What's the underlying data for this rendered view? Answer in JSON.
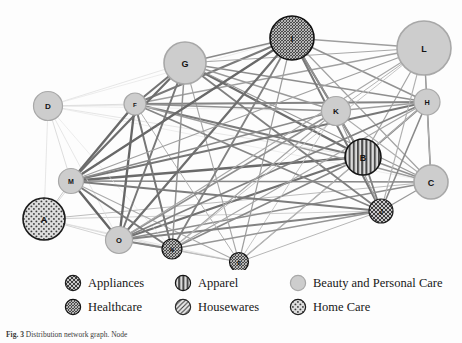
{
  "figure": {
    "caption_label": "Fig. 3",
    "caption_text": "Distribution network graph. Node",
    "background": "#fdfdfd"
  },
  "chart_data": {
    "type": "network-graph",
    "title": "",
    "grid": false,
    "legend_position": "bottom",
    "categories": [
      {
        "key": "appliances",
        "label": "Appliances",
        "pattern": "crosshatch-diagonal",
        "fill": "#c9c9c9",
        "stroke": "#1c1c1c"
      },
      {
        "key": "apparel",
        "label": "Apparel",
        "pattern": "vertical-stripes",
        "fill": "#bdbdbd",
        "stroke": "#141414"
      },
      {
        "key": "beauty",
        "label": "Beauty and Personal Care",
        "pattern": "solid",
        "fill": "#cdcdcd",
        "stroke": "#a8a8a8"
      },
      {
        "key": "healthcare",
        "label": "Healthcare",
        "pattern": "dense-mesh",
        "fill": "#6e6e6e",
        "stroke": "#111111"
      },
      {
        "key": "housewares",
        "label": "Housewares",
        "pattern": "diagonal-lines",
        "fill": "#e2e2e2",
        "stroke": "#2a2a2a"
      },
      {
        "key": "homecare",
        "label": "Home Care",
        "pattern": "dots",
        "fill": "#d8d8d8",
        "stroke": "#1c1c1c"
      }
    ],
    "nodes": [
      {
        "id": "A",
        "label": "A",
        "x": 44,
        "y": 219,
        "r": 21,
        "category": "homecare"
      },
      {
        "id": "B",
        "label": "B",
        "x": 363,
        "y": 157,
        "r": 18,
        "category": "apparel"
      },
      {
        "id": "C",
        "label": "C",
        "x": 431,
        "y": 182,
        "r": 17,
        "category": "beauty"
      },
      {
        "id": "D",
        "label": "D",
        "x": 48,
        "y": 106,
        "r": 14.5,
        "category": "beauty"
      },
      {
        "id": "E",
        "label": "E",
        "x": 239,
        "y": 262,
        "r": 9.5,
        "category": "healthcare"
      },
      {
        "id": "F",
        "label": "F",
        "x": 135,
        "y": 104,
        "r": 11,
        "category": "beauty"
      },
      {
        "id": "G",
        "label": "G",
        "x": 185,
        "y": 63,
        "r": 21,
        "category": "beauty"
      },
      {
        "id": "H",
        "label": "H",
        "x": 427,
        "y": 102,
        "r": 13,
        "category": "beauty"
      },
      {
        "id": "I",
        "label": "I",
        "x": 292,
        "y": 38,
        "r": 22,
        "category": "healthcare"
      },
      {
        "id": "J",
        "label": "J",
        "x": 381,
        "y": 211,
        "r": 12,
        "category": "appliances"
      },
      {
        "id": "K",
        "label": "K",
        "x": 336,
        "y": 111,
        "r": 14.5,
        "category": "beauty"
      },
      {
        "id": "L",
        "label": "L",
        "x": 424,
        "y": 48,
        "r": 27,
        "category": "beauty"
      },
      {
        "id": "M",
        "label": "M",
        "x": 71,
        "y": 181,
        "r": 12.5,
        "category": "beauty"
      },
      {
        "id": "N",
        "label": "N",
        "x": 172,
        "y": 249,
        "r": 10,
        "category": "healthcare"
      },
      {
        "id": "O",
        "label": "O",
        "x": 119,
        "y": 240,
        "r": 13.5,
        "category": "beauty"
      }
    ],
    "edges": [
      {
        "source": "A",
        "target": "M",
        "weight": 1.0,
        "shade": "#c8c8c8"
      },
      {
        "source": "A",
        "target": "O",
        "weight": 0.9,
        "shade": "#cfcfcf"
      },
      {
        "source": "A",
        "target": "D",
        "weight": 0.7,
        "shade": "#dcdcdc"
      },
      {
        "source": "A",
        "target": "F",
        "weight": 0.8,
        "shade": "#d2d2d2"
      },
      {
        "source": "A",
        "target": "C",
        "weight": 1.0,
        "shade": "#bdbdbd"
      },
      {
        "source": "A",
        "target": "N",
        "weight": 0.8,
        "shade": "#d5d5d5"
      },
      {
        "source": "A",
        "target": "J",
        "weight": 0.9,
        "shade": "#cbcbcb"
      },
      {
        "source": "A",
        "target": "E",
        "weight": 0.7,
        "shade": "#dadada"
      },
      {
        "source": "B",
        "target": "M",
        "weight": 2.4,
        "shade": "#6a6a6a"
      },
      {
        "source": "B",
        "target": "O",
        "weight": 2.2,
        "shade": "#707070"
      },
      {
        "source": "B",
        "target": "F",
        "weight": 2.0,
        "shade": "#7a7a7a"
      },
      {
        "source": "B",
        "target": "G",
        "weight": 2.2,
        "shade": "#6d6d6d"
      },
      {
        "source": "B",
        "target": "I",
        "weight": 2.0,
        "shade": "#787878"
      },
      {
        "source": "B",
        "target": "H",
        "weight": 1.8,
        "shade": "#8a8a8a"
      },
      {
        "source": "B",
        "target": "K",
        "weight": 1.4,
        "shade": "#9a9a9a"
      },
      {
        "source": "B",
        "target": "C",
        "weight": 1.5,
        "shade": "#909090"
      },
      {
        "source": "B",
        "target": "J",
        "weight": 1.8,
        "shade": "#7e7e7e"
      },
      {
        "source": "B",
        "target": "L",
        "weight": 1.2,
        "shade": "#a5a5a5"
      },
      {
        "source": "B",
        "target": "N",
        "weight": 1.6,
        "shade": "#888888"
      },
      {
        "source": "B",
        "target": "E",
        "weight": 1.2,
        "shade": "#a0a0a0"
      },
      {
        "source": "C",
        "target": "M",
        "weight": 1.6,
        "shade": "#888888"
      },
      {
        "source": "C",
        "target": "O",
        "weight": 1.5,
        "shade": "#8e8e8e"
      },
      {
        "source": "C",
        "target": "F",
        "weight": 1.3,
        "shade": "#9c9c9c"
      },
      {
        "source": "C",
        "target": "G",
        "weight": 1.3,
        "shade": "#9a9a9a"
      },
      {
        "source": "C",
        "target": "H",
        "weight": 1.6,
        "shade": "#7e7e7e"
      },
      {
        "source": "C",
        "target": "I",
        "weight": 1.2,
        "shade": "#a2a2a2"
      },
      {
        "source": "C",
        "target": "K",
        "weight": 1.1,
        "shade": "#aeaeae"
      },
      {
        "source": "C",
        "target": "L",
        "weight": 1.1,
        "shade": "#b0b0b0"
      },
      {
        "source": "C",
        "target": "J",
        "weight": 1.3,
        "shade": "#999999"
      },
      {
        "source": "D",
        "target": "M",
        "weight": 0.8,
        "shade": "#d4d4d4"
      },
      {
        "source": "D",
        "target": "F",
        "weight": 0.8,
        "shade": "#d6d6d6"
      },
      {
        "source": "D",
        "target": "G",
        "weight": 0.7,
        "shade": "#dddddd"
      },
      {
        "source": "D",
        "target": "O",
        "weight": 0.7,
        "shade": "#dcdcdc"
      },
      {
        "source": "D",
        "target": "H",
        "weight": 0.7,
        "shade": "#dfdfdf"
      },
      {
        "source": "D",
        "target": "K",
        "weight": 0.6,
        "shade": "#e2e2e2"
      },
      {
        "source": "D",
        "target": "I",
        "weight": 0.6,
        "shade": "#e0e0e0"
      },
      {
        "source": "D",
        "target": "B",
        "weight": 0.7,
        "shade": "#dbdbdb"
      },
      {
        "source": "D",
        "target": "C",
        "weight": 0.6,
        "shade": "#e3e3e3"
      },
      {
        "source": "D",
        "target": "N",
        "weight": 0.6,
        "shade": "#e1e1e1"
      },
      {
        "source": "E",
        "target": "M",
        "weight": 1.1,
        "shade": "#ababab"
      },
      {
        "source": "E",
        "target": "O",
        "weight": 1.0,
        "shade": "#b4b4b4"
      },
      {
        "source": "E",
        "target": "F",
        "weight": 1.0,
        "shade": "#b2b2b2"
      },
      {
        "source": "E",
        "target": "G",
        "weight": 1.1,
        "shade": "#a8a8a8"
      },
      {
        "source": "E",
        "target": "I",
        "weight": 1.2,
        "shade": "#9e9e9e"
      },
      {
        "source": "E",
        "target": "K",
        "weight": 0.9,
        "shade": "#c0c0c0"
      },
      {
        "source": "E",
        "target": "H",
        "weight": 0.9,
        "shade": "#bcbcbc"
      },
      {
        "source": "E",
        "target": "N",
        "weight": 0.9,
        "shade": "#bebebe"
      },
      {
        "source": "E",
        "target": "J",
        "weight": 1.0,
        "shade": "#b6b6b6"
      },
      {
        "source": "F",
        "target": "M",
        "weight": 2.3,
        "shade": "#6a6a6a"
      },
      {
        "source": "F",
        "target": "O",
        "weight": 2.3,
        "shade": "#666666"
      },
      {
        "source": "F",
        "target": "G",
        "weight": 2.1,
        "shade": "#747474"
      },
      {
        "source": "F",
        "target": "I",
        "weight": 2.0,
        "shade": "#7a7a7a"
      },
      {
        "source": "F",
        "target": "H",
        "weight": 1.8,
        "shade": "#848484"
      },
      {
        "source": "F",
        "target": "K",
        "weight": 1.5,
        "shade": "#929292"
      },
      {
        "source": "F",
        "target": "L",
        "weight": 1.3,
        "shade": "#a0a0a0"
      },
      {
        "source": "F",
        "target": "J",
        "weight": 1.7,
        "shade": "#868686"
      },
      {
        "source": "F",
        "target": "N",
        "weight": 2.0,
        "shade": "#767676"
      },
      {
        "source": "G",
        "target": "M",
        "weight": 2.2,
        "shade": "#6e6e6e"
      },
      {
        "source": "G",
        "target": "O",
        "weight": 2.0,
        "shade": "#787878"
      },
      {
        "source": "G",
        "target": "I",
        "weight": 1.7,
        "shade": "#8a8a8a"
      },
      {
        "source": "G",
        "target": "H",
        "weight": 1.6,
        "shade": "#8e8e8e"
      },
      {
        "source": "G",
        "target": "K",
        "weight": 1.4,
        "shade": "#9a9a9a"
      },
      {
        "source": "G",
        "target": "L",
        "weight": 1.2,
        "shade": "#a8a8a8"
      },
      {
        "source": "G",
        "target": "J",
        "weight": 1.8,
        "shade": "#808080"
      },
      {
        "source": "G",
        "target": "N",
        "weight": 1.5,
        "shade": "#949494"
      },
      {
        "source": "H",
        "target": "M",
        "weight": 2.0,
        "shade": "#767676"
      },
      {
        "source": "H",
        "target": "O",
        "weight": 1.8,
        "shade": "#828282"
      },
      {
        "source": "H",
        "target": "I",
        "weight": 1.5,
        "shade": "#929292"
      },
      {
        "source": "H",
        "target": "K",
        "weight": 1.3,
        "shade": "#a0a0a0"
      },
      {
        "source": "H",
        "target": "L",
        "weight": 1.4,
        "shade": "#9a9a9a"
      },
      {
        "source": "H",
        "target": "J",
        "weight": 1.6,
        "shade": "#8a8a8a"
      },
      {
        "source": "H",
        "target": "N",
        "weight": 1.2,
        "shade": "#a6a6a6"
      },
      {
        "source": "I",
        "target": "M",
        "weight": 2.3,
        "shade": "#686868"
      },
      {
        "source": "I",
        "target": "O",
        "weight": 2.2,
        "shade": "#6e6e6e"
      },
      {
        "source": "I",
        "target": "K",
        "weight": 1.5,
        "shade": "#909090"
      },
      {
        "source": "I",
        "target": "L",
        "weight": 1.3,
        "shade": "#9e9e9e"
      },
      {
        "source": "I",
        "target": "J",
        "weight": 2.0,
        "shade": "#787878"
      },
      {
        "source": "I",
        "target": "N",
        "weight": 1.8,
        "shade": "#828282"
      },
      {
        "source": "J",
        "target": "M",
        "weight": 1.9,
        "shade": "#7c7c7c"
      },
      {
        "source": "J",
        "target": "O",
        "weight": 1.8,
        "shade": "#828282"
      },
      {
        "source": "J",
        "target": "K",
        "weight": 1.2,
        "shade": "#a4a4a4"
      },
      {
        "source": "J",
        "target": "L",
        "weight": 1.1,
        "shade": "#b0b0b0"
      },
      {
        "source": "J",
        "target": "N",
        "weight": 1.4,
        "shade": "#969696"
      },
      {
        "source": "K",
        "target": "M",
        "weight": 1.6,
        "shade": "#8a8a8a"
      },
      {
        "source": "K",
        "target": "O",
        "weight": 1.5,
        "shade": "#909090"
      },
      {
        "source": "K",
        "target": "L",
        "weight": 1.0,
        "shade": "#b4b4b4"
      },
      {
        "source": "K",
        "target": "N",
        "weight": 1.2,
        "shade": "#a6a6a6"
      },
      {
        "source": "L",
        "target": "M",
        "weight": 1.3,
        "shade": "#a0a0a0"
      },
      {
        "source": "L",
        "target": "O",
        "weight": 1.2,
        "shade": "#a8a8a8"
      },
      {
        "source": "L",
        "target": "N",
        "weight": 0.9,
        "shade": "#c0c0c0"
      },
      {
        "source": "M",
        "target": "O",
        "weight": 2.4,
        "shade": "#646464"
      },
      {
        "source": "M",
        "target": "N",
        "weight": 2.0,
        "shade": "#7a7a7a"
      },
      {
        "source": "N",
        "target": "O",
        "weight": 1.8,
        "shade": "#848484"
      }
    ]
  },
  "legend": {
    "rows": [
      [
        {
          "key": "appliances",
          "label": "Appliances"
        },
        {
          "key": "apparel",
          "label": "Apparel"
        },
        {
          "key": "beauty",
          "label": "Beauty and Personal Care"
        }
      ],
      [
        {
          "key": "healthcare",
          "label": "Healthcare"
        },
        {
          "key": "housewares",
          "label": "Housewares"
        },
        {
          "key": "homecare",
          "label": "Home Care"
        }
      ]
    ]
  }
}
